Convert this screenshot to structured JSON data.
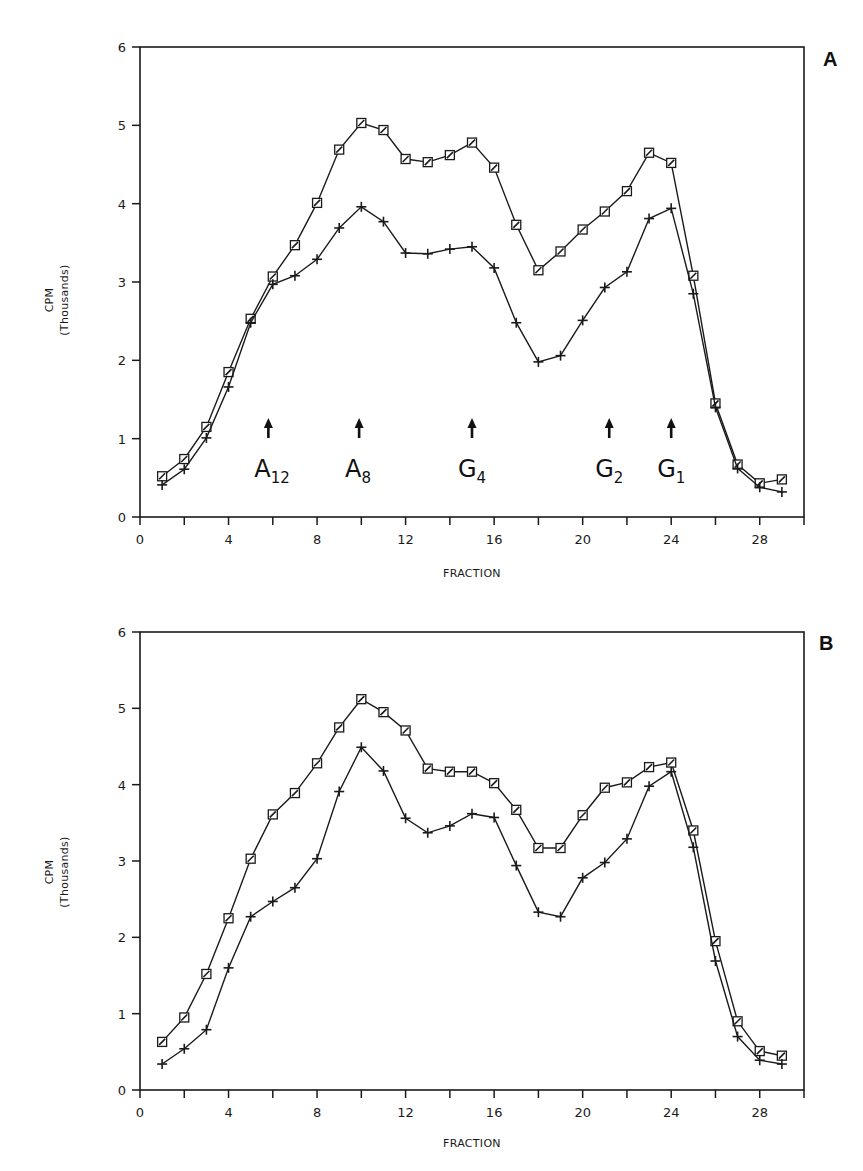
{
  "chart_data": [
    {
      "type": "line",
      "panel_label": "A",
      "title": "",
      "xlabel": "FRACTION",
      "ylabel": "CPM",
      "ylabel_sub": "(Thousands)",
      "xlim": [
        0,
        30
      ],
      "ylim": [
        0,
        6
      ],
      "x_ticks": [
        0,
        2,
        4,
        6,
        8,
        10,
        12,
        14,
        16,
        18,
        20,
        22,
        24,
        26,
        28,
        30
      ],
      "x_tick_labels": [
        "0",
        "4",
        "8",
        "12",
        "16",
        "20",
        "24",
        "28"
      ],
      "x_tick_label_values": [
        0,
        4,
        8,
        12,
        16,
        20,
        24,
        28
      ],
      "y_ticks": [
        0,
        1,
        2,
        3,
        4,
        5,
        6
      ],
      "y_tick_labels": [
        "0",
        "1",
        "2",
        "3",
        "4",
        "5",
        "6"
      ],
      "grid": false,
      "x": [
        1,
        2,
        3,
        4,
        5,
        6,
        7,
        8,
        9,
        10,
        11,
        12,
        13,
        14,
        15,
        16,
        17,
        18,
        19,
        20,
        21,
        22,
        23,
        24,
        25,
        26,
        27,
        28,
        29
      ],
      "series": [
        {
          "name": "square",
          "marker": "square",
          "values": [
            0.52,
            0.74,
            1.15,
            1.85,
            2.53,
            3.07,
            3.47,
            4.01,
            4.69,
            5.03,
            4.94,
            4.57,
            4.53,
            4.62,
            4.78,
            4.46,
            3.73,
            3.15,
            3.39,
            3.67,
            3.9,
            4.16,
            4.65,
            4.52,
            3.08,
            1.45,
            0.67,
            0.43,
            0.48
          ]
        },
        {
          "name": "plus",
          "marker": "plus",
          "values": [
            0.41,
            0.61,
            1.01,
            1.66,
            2.48,
            2.97,
            3.08,
            3.29,
            3.69,
            3.96,
            3.77,
            3.37,
            3.36,
            3.42,
            3.45,
            3.18,
            2.48,
            1.98,
            2.06,
            2.51,
            2.93,
            3.13,
            3.81,
            3.94,
            2.85,
            1.4,
            0.62,
            0.38,
            0.32
          ]
        }
      ],
      "annotations": [
        {
          "label": "A",
          "sub": "12",
          "x": 5.8
        },
        {
          "label": "A",
          "sub": "8",
          "x": 9.9
        },
        {
          "label": "G",
          "sub": "4",
          "x": 15.0
        },
        {
          "label": "G",
          "sub": "2",
          "x": 21.2
        },
        {
          "label": "G",
          "sub": "1",
          "x": 24.0
        }
      ]
    },
    {
      "type": "line",
      "panel_label": "B",
      "title": "",
      "xlabel": "FRACTION",
      "ylabel": "CPM",
      "ylabel_sub": "(Thousands)",
      "xlim": [
        0,
        30
      ],
      "ylim": [
        0,
        6
      ],
      "x_ticks": [
        0,
        2,
        4,
        6,
        8,
        10,
        12,
        14,
        16,
        18,
        20,
        22,
        24,
        26,
        28,
        30
      ],
      "x_tick_labels": [
        "0",
        "4",
        "8",
        "12",
        "16",
        "20",
        "24",
        "28"
      ],
      "x_tick_label_values": [
        0,
        4,
        8,
        12,
        16,
        20,
        24,
        28
      ],
      "y_ticks": [
        0,
        1,
        2,
        3,
        4,
        5,
        6
      ],
      "y_tick_labels": [
        "0",
        "1",
        "2",
        "3",
        "4",
        "5",
        "6"
      ],
      "grid": false,
      "x": [
        1,
        2,
        3,
        4,
        5,
        6,
        7,
        8,
        9,
        10,
        11,
        12,
        13,
        14,
        15,
        16,
        17,
        18,
        19,
        20,
        21,
        22,
        23,
        24,
        25,
        26,
        27,
        28,
        29
      ],
      "series": [
        {
          "name": "square",
          "marker": "square",
          "values": [
            0.63,
            0.95,
            1.52,
            2.25,
            3.03,
            3.61,
            3.89,
            4.28,
            4.75,
            5.12,
            4.95,
            4.71,
            4.21,
            4.17,
            4.17,
            4.02,
            3.67,
            3.17,
            3.17,
            3.6,
            3.96,
            4.03,
            4.23,
            4.29,
            3.4,
            1.95,
            0.9,
            0.51,
            0.45
          ]
        },
        {
          "name": "plus",
          "marker": "plus",
          "values": [
            0.34,
            0.54,
            0.79,
            1.6,
            2.27,
            2.47,
            2.65,
            3.03,
            3.91,
            4.49,
            4.18,
            3.56,
            3.37,
            3.46,
            3.62,
            3.57,
            2.94,
            2.33,
            2.27,
            2.78,
            2.98,
            3.29,
            3.98,
            4.17,
            3.18,
            1.69,
            0.7,
            0.39,
            0.34
          ]
        }
      ],
      "annotations": []
    }
  ]
}
